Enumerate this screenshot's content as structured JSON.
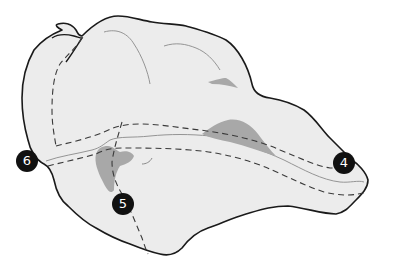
{
  "map": {
    "colors": {
      "background": "#ffffff",
      "land": "#ececec",
      "outline": "#1a1a1a",
      "river": "#8a8a8a",
      "lake": "#a8a8a8",
      "route": "#3a3a3a",
      "marker_fill": "#111111",
      "marker_text": "#ffffff"
    },
    "markers": [
      {
        "id": "marker-4",
        "label": "4",
        "x": 344,
        "y": 163
      },
      {
        "id": "marker-5",
        "label": "5",
        "x": 123,
        "y": 204
      },
      {
        "id": "marker-6",
        "label": "6",
        "x": 27,
        "y": 161
      }
    ]
  }
}
